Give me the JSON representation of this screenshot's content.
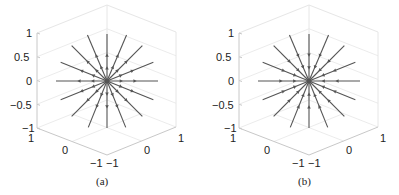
{
  "figure": {
    "panels": [
      {
        "id": "a",
        "caption": "(a)",
        "flow_direction": "outward",
        "z_ticks": [
          "1",
          "0.5",
          "0",
          "−0.5",
          "−1"
        ],
        "x_ticks": [
          "1",
          "0",
          "−1"
        ],
        "y_ticks": [
          "−1",
          "0",
          "1"
        ]
      },
      {
        "id": "b",
        "caption": "(b)",
        "flow_direction": "inward",
        "z_ticks": [
          "1",
          "0.5",
          "0",
          "−0.5",
          "−1"
        ],
        "x_ticks": [
          "1",
          "0",
          "−1"
        ],
        "y_ticks": [
          "−1",
          "0",
          "1"
        ]
      }
    ],
    "line_color": "#555555",
    "grid_color": "#e6e6e6",
    "axis_color": "#c8c8c8"
  }
}
